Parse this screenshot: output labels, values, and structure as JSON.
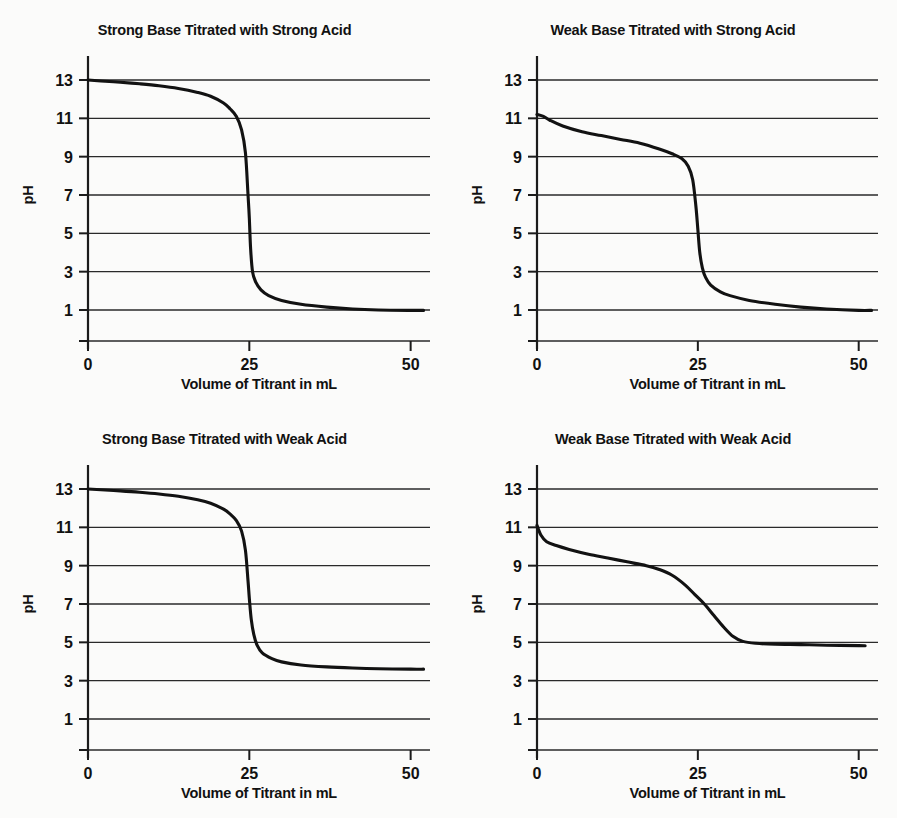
{
  "figure": {
    "background_color": "#fbfbfa",
    "ink_color": "#121212",
    "panel_count": 4
  },
  "common": {
    "xlabel": "Volume of Titrant in mL",
    "ylabel": "pH",
    "xticks": [
      0,
      25,
      50
    ],
    "xtick_labels": [
      "0",
      "25",
      "50"
    ],
    "yticks": [
      1,
      3,
      5,
      7,
      9,
      11,
      13
    ],
    "ytick_labels": [
      "1",
      "3",
      "5",
      "7",
      "9",
      "11",
      "13"
    ],
    "xlim": [
      0,
      53
    ],
    "ylim": [
      -1,
      14
    ],
    "grid": true,
    "legend": "none"
  },
  "chart_data": [
    {
      "type": "line",
      "id": "strong-base-strong-acid",
      "title": "Strong Base Titrated with Strong  Acid",
      "xlabel": "Volume of Titrant in mL",
      "ylabel": "pH",
      "xlim": [
        0,
        53
      ],
      "ylim": [
        -1,
        14
      ],
      "xticks": [
        0,
        25,
        50
      ],
      "yticks": [
        1,
        3,
        5,
        7,
        9,
        11,
        13
      ],
      "grid": true,
      "series": [
        {
          "name": "pH vs volume",
          "x": [
            0,
            2,
            5,
            8,
            11,
            14,
            17,
            19,
            21,
            22,
            23,
            23.8,
            24.4,
            24.8,
            25.0,
            25.2,
            25.5,
            26.0,
            26.8,
            28,
            30,
            33,
            37,
            41,
            45,
            50,
            52
          ],
          "y": [
            13.0,
            12.95,
            12.88,
            12.8,
            12.7,
            12.56,
            12.35,
            12.15,
            11.8,
            11.5,
            11.1,
            10.4,
            9.2,
            7.0,
            5.8,
            4.2,
            3.0,
            2.45,
            2.05,
            1.75,
            1.5,
            1.3,
            1.15,
            1.05,
            1.0,
            0.98,
            0.98
          ]
        }
      ]
    },
    {
      "type": "line",
      "id": "weak-base-strong-acid",
      "title": "Weak Base Titrated with Strong Acid",
      "xlabel": "Volume of Titrant in mL",
      "ylabel": "pH",
      "xlim": [
        0,
        53
      ],
      "ylim": [
        -1,
        14
      ],
      "xticks": [
        0,
        25,
        50
      ],
      "yticks": [
        1,
        3,
        5,
        7,
        9,
        11,
        13
      ],
      "grid": true,
      "series": [
        {
          "name": "pH vs volume",
          "x": [
            0,
            1,
            2,
            4,
            7,
            10,
            13,
            16,
            19,
            21,
            22.5,
            23.5,
            24.2,
            24.7,
            25.0,
            25.3,
            25.7,
            26.2,
            27,
            28.5,
            30,
            33,
            37,
            41,
            45,
            50,
            52
          ],
          "y": [
            11.2,
            11.1,
            10.9,
            10.6,
            10.3,
            10.1,
            9.9,
            9.7,
            9.4,
            9.15,
            8.9,
            8.5,
            7.8,
            6.4,
            5.2,
            4.0,
            3.2,
            2.7,
            2.3,
            1.95,
            1.75,
            1.5,
            1.3,
            1.15,
            1.05,
            0.98,
            0.98
          ]
        }
      ]
    },
    {
      "type": "line",
      "id": "strong-base-weak-acid",
      "title": "Strong Base Titrated with Weak Acid",
      "xlabel": "Volume of Titrant in mL",
      "ylabel": "pH",
      "xlim": [
        0,
        53
      ],
      "ylim": [
        -1,
        14
      ],
      "xticks": [
        0,
        25,
        50
      ],
      "yticks": [
        1,
        3,
        5,
        7,
        9,
        11,
        13
      ],
      "grid": true,
      "series": [
        {
          "name": "pH vs volume",
          "x": [
            0,
            2,
            5,
            8,
            11,
            14,
            17,
            19,
            21,
            22,
            23,
            23.8,
            24.4,
            24.8,
            25.0,
            25.3,
            25.7,
            26.2,
            27,
            28.5,
            30,
            33,
            37,
            41,
            45,
            50,
            52
          ],
          "y": [
            13.0,
            12.96,
            12.9,
            12.83,
            12.74,
            12.62,
            12.44,
            12.26,
            11.95,
            11.7,
            11.35,
            10.8,
            9.8,
            8.2,
            7.3,
            6.2,
            5.4,
            4.85,
            4.45,
            4.15,
            3.98,
            3.82,
            3.72,
            3.66,
            3.62,
            3.6,
            3.6
          ]
        }
      ]
    },
    {
      "type": "line",
      "id": "weak-base-weak-acid",
      "title": "Weak Base Titrated with Weak Acid",
      "xlabel": "Volume of Titrant in mL",
      "ylabel": "pH",
      "xlim": [
        0,
        53
      ],
      "ylim": [
        -1,
        14
      ],
      "xticks": [
        0,
        25,
        50
      ],
      "yticks": [
        1,
        3,
        5,
        7,
        9,
        11,
        13
      ],
      "grid": true,
      "series": [
        {
          "name": "pH vs volume",
          "x": [
            0,
            0.6,
            1.5,
            3,
            5,
            8,
            11,
            14,
            17,
            19,
            21,
            23,
            24.5,
            26,
            27.5,
            29,
            30.5,
            32,
            34,
            37,
            41,
            45,
            50,
            51
          ],
          "y": [
            11.1,
            10.6,
            10.25,
            10.05,
            9.85,
            9.6,
            9.4,
            9.2,
            9.0,
            8.8,
            8.5,
            8.0,
            7.5,
            7.0,
            6.4,
            5.8,
            5.3,
            5.05,
            4.95,
            4.9,
            4.88,
            4.85,
            4.83,
            4.82
          ]
        }
      ]
    }
  ]
}
